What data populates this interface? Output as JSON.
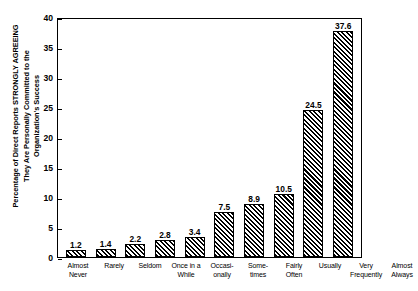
{
  "chart_data": {
    "type": "bar",
    "title": "",
    "xlabel": "",
    "ylabel": "Percentage of Direct Reports  STRONGLY AGREEING\nThey Are Personally Committed to the\nOrganization's Success",
    "categories": [
      "Almost\nNever",
      "Rarely",
      "Seldom",
      "Once in a\nWhile",
      "Occasi-\nonally",
      "Some-\ntimes",
      "Fairly\nOften",
      "Usually",
      "Very\nFrequently",
      "Almost\nAlways"
    ],
    "values": [
      1.2,
      1.4,
      2.2,
      2.8,
      3.4,
      7.5,
      8.9,
      10.5,
      24.5,
      37.6
    ],
    "value_labels": [
      "1.2",
      "1.4",
      "2.2",
      "2.8",
      "3.4",
      "7.5",
      "8.9",
      "10.5",
      "24.5",
      "37.6"
    ],
    "ylim": [
      0,
      40
    ],
    "ytick_values": [
      0,
      5,
      10,
      15,
      20,
      25,
      30,
      35,
      40
    ],
    "ytick_labels": [
      "0",
      "5",
      "10",
      "15",
      "20",
      "25",
      "30",
      "35",
      "40"
    ],
    "grid": false,
    "legend": false,
    "legend_position": "none",
    "bar_fill": "diagonal-hatch",
    "bar_color": "#000000",
    "background_color": "#ffffff"
  }
}
